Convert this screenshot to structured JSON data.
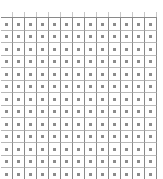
{
  "grid": {
    "columns": 13,
    "rows": 13,
    "line_color": "#8a8a8a",
    "dot_color": "#8c8c8c",
    "background": "#ffffff",
    "cell_marker_icon": "square-dot-icon"
  }
}
